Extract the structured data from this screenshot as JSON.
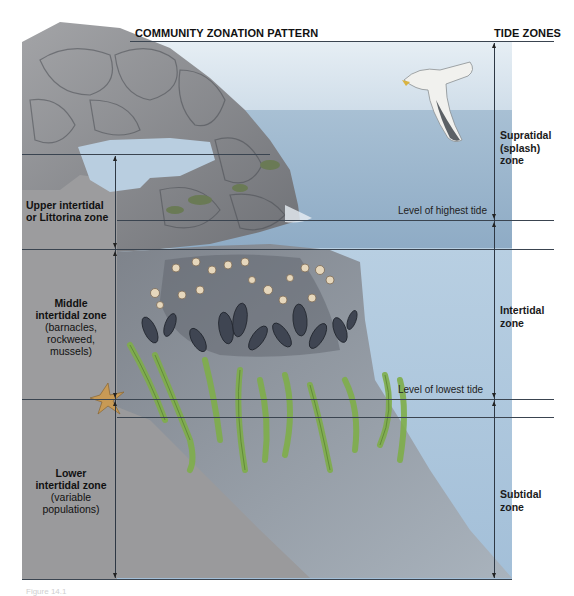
{
  "diagram": {
    "title": "COMMUNITY ZONATION PATTERN",
    "right_title": "TIDE ZONES",
    "caption": "Figure 14.1",
    "left_zones": [
      {
        "name": "Upper intertidal",
        "name2": "or Littorina zone",
        "detail": ""
      },
      {
        "name": "Middle",
        "name2": "intertidal zone",
        "detail": "(barnacles,",
        "detail2": "rockweed,",
        "detail3": "mussels)"
      },
      {
        "name": "Lower",
        "name2": "intertidal zone",
        "detail": "(variable",
        "detail2": "populations)"
      }
    ],
    "tide_levels": [
      {
        "label": "Level of highest tide"
      },
      {
        "label": "Level of lowest tide"
      }
    ],
    "right_zones": [
      {
        "line1": "Supratidal",
        "line2": "(splash)",
        "line3": "zone"
      },
      {
        "line1": "Intertidal",
        "line2": "zone"
      },
      {
        "line1": "Subtidal",
        "line2": "zone"
      }
    ],
    "illustration_elements": [
      "rocky-arch",
      "seagull",
      "barnacles",
      "mussels",
      "rockweed-kelp",
      "sea-star",
      "rock-slope"
    ],
    "colors": {
      "sky": "#d6e2ec",
      "sea_surface": "#9fb9d0",
      "water": "#a9c3da",
      "rock_gray": "#8e9094",
      "slope_gray": "#9b9b9d",
      "kelp_green": "#7fae4a",
      "mussel": "#3e4450",
      "barnacle": "#e7d6b8",
      "seastar": "#c89a55",
      "line": "#3a4450"
    }
  }
}
